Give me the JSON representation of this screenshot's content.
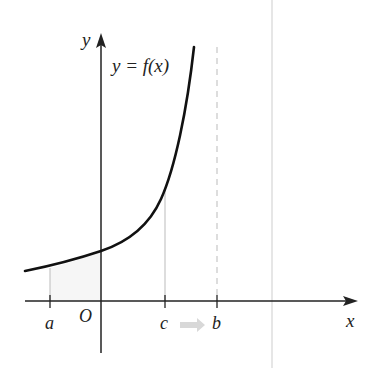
{
  "figure": {
    "type": "function-graph",
    "curve_label": "y = f(x)",
    "axes": {
      "x_label": "x",
      "y_label": "y",
      "origin_label": "O"
    },
    "points": [
      {
        "name": "a",
        "label": "a"
      },
      {
        "name": "c",
        "label": "c"
      },
      {
        "name": "b",
        "label": "b"
      }
    ],
    "colors": {
      "curve": "#111111",
      "axes": "#222222",
      "guides": "#bbbbbb",
      "arrow": "#cccccc",
      "border": "#e4e4e4"
    }
  }
}
